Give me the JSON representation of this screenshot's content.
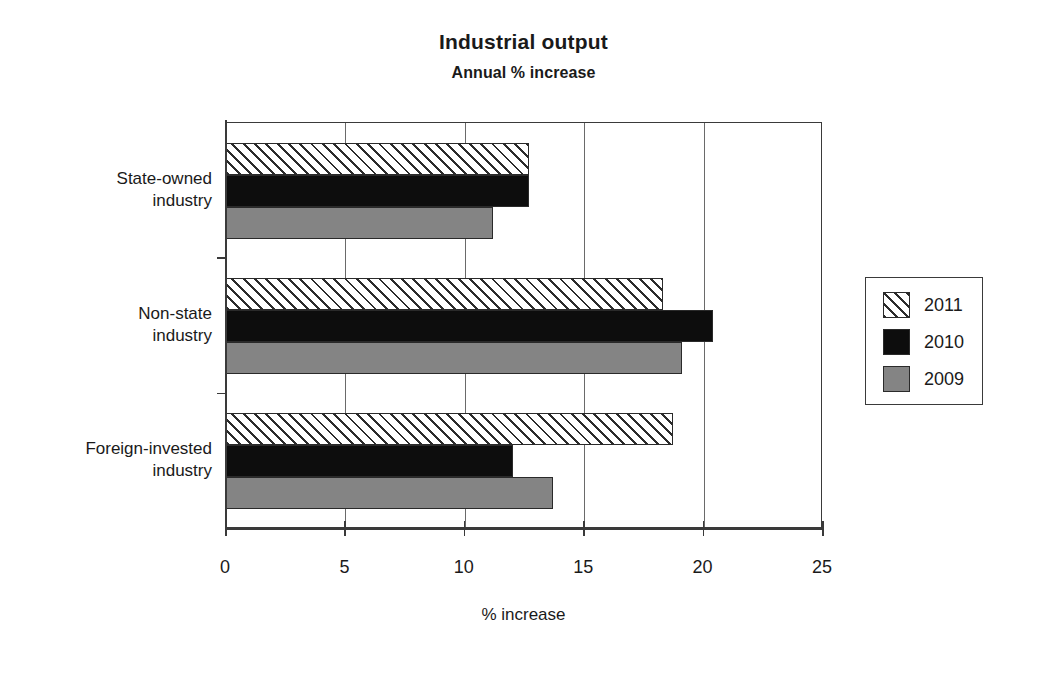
{
  "chart_data": {
    "type": "bar",
    "orientation": "horizontal",
    "title": "Industrial output",
    "subtitle": "Annual % increase",
    "xlabel": "% increase",
    "ylabel": "",
    "categories": [
      "State-owned industry",
      "Non-state industry",
      "Foreign-invested industry"
    ],
    "category_lines": [
      [
        "State-owned",
        "industry"
      ],
      [
        "Non-state",
        "industry"
      ],
      [
        "Foreign-invested",
        "industry"
      ]
    ],
    "series": [
      {
        "name": "2011",
        "values": [
          12.7,
          18.3,
          18.7
        ],
        "fill": "diagonal-hatch",
        "color": "#ffffff"
      },
      {
        "name": "2010",
        "values": [
          12.7,
          20.4,
          12.0
        ],
        "fill": "solid",
        "color": "#0d0d0d"
      },
      {
        "name": "2009",
        "values": [
          11.2,
          19.1,
          13.7
        ],
        "fill": "solid",
        "color": "#848484"
      }
    ],
    "xlim": [
      0,
      25
    ],
    "xticks": [
      0,
      5,
      10,
      15,
      20,
      25
    ],
    "xtick_labels": [
      "0",
      "5",
      "10",
      "15",
      "20",
      "25"
    ],
    "grid": "vertical",
    "legend_position": "right",
    "legend_entries": [
      "2011",
      "2010",
      "2009"
    ]
  }
}
